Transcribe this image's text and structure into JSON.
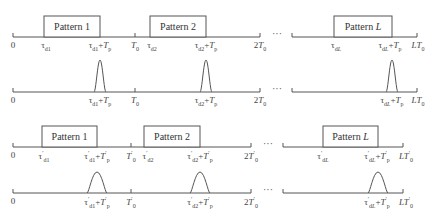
{
  "rows": [
    {
      "id": "tx-original",
      "type": "patterns",
      "axis_y": 37,
      "segments": [
        [
          13,
          260
        ],
        [
          292,
          417
        ]
      ],
      "ticks": [
        13,
        135,
        260,
        292,
        417
      ],
      "patterns": [
        {
          "label": "Pattern 1",
          "x1": 44,
          "x2": 100
        },
        {
          "label": "Pattern 2",
          "x1": 150,
          "x2": 206
        },
        {
          "label": "Pattern L",
          "x1": 334,
          "x2": 392
        }
      ],
      "labels": [
        {
          "x": 13,
          "text": "0"
        },
        {
          "x": 46,
          "text": "τd1"
        },
        {
          "x": 100,
          "text": "τd1+Tp"
        },
        {
          "x": 135,
          "text": "T0"
        },
        {
          "x": 152,
          "text": "τd2"
        },
        {
          "x": 206,
          "text": "τd2+Tp"
        },
        {
          "x": 260,
          "text": "2T0"
        },
        {
          "x": 336,
          "text": "τdL"
        },
        {
          "x": 390,
          "text": "τdL+Tp"
        },
        {
          "x": 418,
          "text": "LT0"
        }
      ],
      "ellipsis_x": 277
    },
    {
      "id": "rx-original",
      "type": "pulses",
      "axis_y": 92,
      "segments": [
        [
          13,
          260
        ],
        [
          292,
          417
        ]
      ],
      "ticks": [
        13,
        135,
        260,
        292,
        417
      ],
      "pulses": [
        100,
        206,
        392
      ],
      "pulse_height": 32,
      "pulse_halfwidth": 4,
      "labels": [
        {
          "x": 13,
          "text": "0"
        },
        {
          "x": 100,
          "text": "τd1+Tp"
        },
        {
          "x": 135,
          "text": "T0"
        },
        {
          "x": 206,
          "text": "τd2+Tp"
        },
        {
          "x": 260,
          "text": "2T0"
        },
        {
          "x": 392,
          "text": "τdL+Tp"
        },
        {
          "x": 418,
          "text": "LT0"
        }
      ],
      "ellipsis_x": 277
    },
    {
      "id": "tx-scaled",
      "type": "patterns",
      "axis_y": 147,
      "segments": [
        [
          13,
          251
        ],
        [
          283,
          403
        ]
      ],
      "ticks": [
        13,
        131,
        251,
        283,
        403
      ],
      "patterns": [
        {
          "label": "Pattern 1",
          "x1": 42,
          "x2": 97
        },
        {
          "label": "Pattern 2",
          "x1": 144,
          "x2": 200
        },
        {
          "label": "Pattern L",
          "x1": 323,
          "x2": 378
        }
      ],
      "labels": [
        {
          "x": 13,
          "text": "0"
        },
        {
          "x": 44,
          "text": "τ'd1"
        },
        {
          "x": 97,
          "text": "τ'd1+T'p"
        },
        {
          "x": 131,
          "text": "T'0"
        },
        {
          "x": 148,
          "text": "τ'd2"
        },
        {
          "x": 200,
          "text": "τ'd2+T'p"
        },
        {
          "x": 251,
          "text": "2T'0"
        },
        {
          "x": 323,
          "text": "τ'dL"
        },
        {
          "x": 377,
          "text": "τ'dL+T'p"
        },
        {
          "x": 406,
          "text": "LT'0"
        }
      ],
      "ellipsis_x": 268
    },
    {
      "id": "rx-scaled",
      "type": "pulses",
      "axis_y": 193,
      "segments": [
        [
          13,
          251
        ],
        [
          283,
          403
        ]
      ],
      "ticks": [
        13,
        131,
        251,
        283,
        403
      ],
      "pulses": [
        97,
        200,
        378
      ],
      "pulse_height": 21,
      "pulse_halfwidth": 8,
      "labels": [
        {
          "x": 13,
          "text": "0"
        },
        {
          "x": 97,
          "text": "τ'd1+T'p"
        },
        {
          "x": 131,
          "text": "T'0"
        },
        {
          "x": 200,
          "text": "τ'd2+T'p"
        },
        {
          "x": 251,
          "text": "2T'0"
        },
        {
          "x": 377,
          "text": "τ'dL+T'p"
        },
        {
          "x": 406,
          "text": "LT'0"
        }
      ],
      "ellipsis_x": 268
    }
  ],
  "ellipsis": "···",
  "colors": {
    "line": "#555555",
    "text": "#444444"
  }
}
